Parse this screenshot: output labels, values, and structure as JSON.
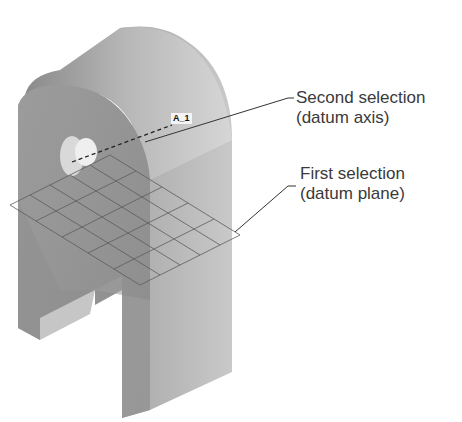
{
  "figure": {
    "type": "cad-part-illustration",
    "axis_tag": "A_1",
    "callouts": [
      {
        "id": "second",
        "line1": "Second selection",
        "line2": "(datum axis)"
      },
      {
        "id": "first",
        "line1": "First selection",
        "line2": "(datum plane)"
      }
    ],
    "colors": {
      "background": "#ffffff",
      "part_face": "#9a9a9a",
      "part_top": "#bdbdbd",
      "part_dark": "#7e7e7e",
      "leader_line": "#333333",
      "text": "#3a3a3a"
    }
  }
}
